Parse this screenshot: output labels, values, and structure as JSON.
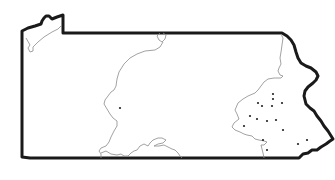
{
  "map": {
    "subject": "Outline map of Pennsylvania",
    "border_color": "#1a1a1a",
    "region_line_color": "#8a8a8a",
    "dot_color": "#222222",
    "dots": [
      {
        "x": 120,
        "y": 108
      },
      {
        "x": 273,
        "y": 94
      },
      {
        "x": 273,
        "y": 99
      },
      {
        "x": 258,
        "y": 103
      },
      {
        "x": 262,
        "y": 106
      },
      {
        "x": 272,
        "y": 106
      },
      {
        "x": 282,
        "y": 103
      },
      {
        "x": 250,
        "y": 116
      },
      {
        "x": 257,
        "y": 119
      },
      {
        "x": 267,
        "y": 121
      },
      {
        "x": 276,
        "y": 120
      },
      {
        "x": 244,
        "y": 126
      },
      {
        "x": 283,
        "y": 130
      },
      {
        "x": 263,
        "y": 140
      },
      {
        "x": 298,
        "y": 144
      },
      {
        "x": 307,
        "y": 140
      },
      {
        "x": 267,
        "y": 150
      }
    ]
  }
}
